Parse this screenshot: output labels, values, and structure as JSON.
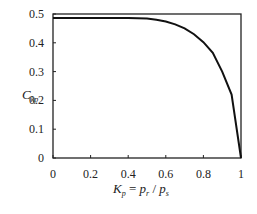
{
  "chart_data": {
    "type": "line",
    "title": "",
    "xlabel": "K_p = p_r / p_s",
    "ylabel": "C_kp",
    "xlim": [
      0,
      1
    ],
    "ylim": [
      0,
      0.5
    ],
    "grid": false,
    "legend": null,
    "x_ticks": [
      "0",
      "0.2",
      "0.4",
      "0.6",
      "0.8",
      "1"
    ],
    "y_ticks": [
      "0",
      "0.1",
      "0.2",
      "0.3",
      "0.4",
      "0.5"
    ],
    "series": [
      {
        "name": "C_kp",
        "x": [
          0,
          0.1,
          0.2,
          0.3,
          0.4,
          0.5,
          0.55,
          0.6,
          0.65,
          0.7,
          0.75,
          0.8,
          0.85,
          0.9,
          0.95,
          1.0
        ],
        "y": [
          0.486,
          0.486,
          0.486,
          0.486,
          0.486,
          0.484,
          0.48,
          0.474,
          0.464,
          0.45,
          0.43,
          0.402,
          0.365,
          0.3,
          0.22,
          0.0
        ]
      }
    ]
  },
  "labels": {
    "y_main": "C",
    "y_sub": "kp",
    "x_K": "K",
    "x_Ksub": "p",
    "x_eq": " = ",
    "x_p1": "p",
    "x_p1sub": "r",
    "x_slash": " / ",
    "x_p2": "p",
    "x_p2sub": "s"
  }
}
